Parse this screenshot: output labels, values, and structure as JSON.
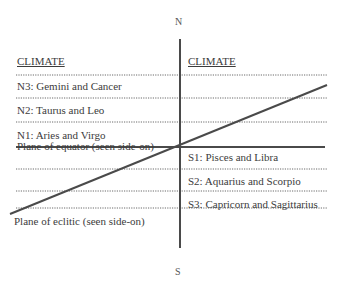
{
  "diagram": {
    "compass": {
      "north": "N",
      "south": "S"
    },
    "left_column": {
      "header": "CLIMATE",
      "zones": [
        {
          "id": "N3",
          "label": "N3: Gemini and Cancer"
        },
        {
          "id": "N2",
          "label": "N2: Taurus and Leo"
        },
        {
          "id": "N1",
          "label": "N1: Aries and Virgo"
        }
      ]
    },
    "right_column": {
      "header": "CLIMATE",
      "zones": [
        {
          "id": "S1",
          "label": "S1: Pisces and Libra"
        },
        {
          "id": "S2",
          "label": "S2: Aquarius and Scorpio"
        },
        {
          "id": "S3",
          "label": "S3: Capricorn and Sagittarius"
        }
      ]
    },
    "planes": {
      "equator": "Plane of equator (seen side-on)",
      "ecliptic": "Plane of eclitic (seen side-on)"
    },
    "colors": {
      "line": "#4a4a4a",
      "dotted": "#6a6a6a",
      "text": "#3c3c3c"
    }
  }
}
